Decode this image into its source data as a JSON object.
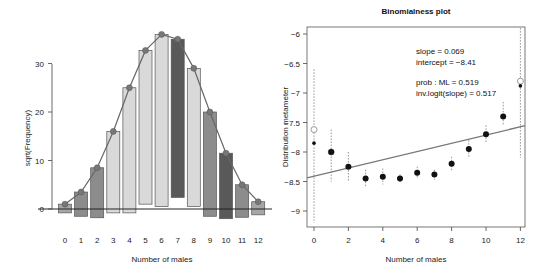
{
  "chart_data": [
    {
      "type": "bar",
      "subtype": "hanging-rootogram",
      "title": "",
      "xlabel": "Number of males",
      "ylabel": "sqrt(Frequency)",
      "categories": [
        "0",
        "1",
        "2",
        "3",
        "4",
        "5",
        "6",
        "7",
        "8",
        "9",
        "10",
        "11",
        "12"
      ],
      "yticks": [
        "0",
        "10",
        "20",
        "30"
      ],
      "ylim": [
        -3,
        38
      ],
      "series": [
        {
          "name": "fitted (sqrt expected)",
          "values": [
            1.0,
            3.5,
            8.5,
            16.0,
            25.0,
            32.7,
            36.0,
            35.0,
            29.0,
            20.0,
            11.5,
            5.0,
            1.5
          ]
        },
        {
          "name": "bar bottom (fitted - sqrt observed)",
          "values": [
            -0.8,
            -1.5,
            -1.8,
            -0.8,
            -0.8,
            1.0,
            0.5,
            2.4,
            0.5,
            -1.5,
            -2.0,
            -1.7,
            -1.2
          ]
        }
      ],
      "bar_colors": [
        "#a6a6a6",
        "#8c8c8c",
        "#8c8c8c",
        "#d9d9d9",
        "#d9d9d9",
        "#d9d9d9",
        "#d9d9d9",
        "#595959",
        "#d9d9d9",
        "#8c8c8c",
        "#595959",
        "#8c8c8c",
        "#a6a6a6"
      ],
      "grid": false
    },
    {
      "type": "scatter",
      "title": "Binomialness plot",
      "xlabel": "Number of males",
      "ylabel": "Distribution metameter",
      "x": [
        0,
        1,
        2,
        3,
        4,
        5,
        6,
        7,
        8,
        9,
        10,
        11,
        12
      ],
      "xticks": [
        "0",
        "2",
        "4",
        "6",
        "8",
        "10",
        "12"
      ],
      "yticks": [
        "-6",
        "-6.5",
        "-7",
        "-7.5",
        "-8",
        "-8.5",
        "-9"
      ],
      "ylim": [
        -9.25,
        -5.9
      ],
      "xlim": [
        -0.4,
        12.4
      ],
      "series": [
        {
          "name": "count metameter",
          "values": [
            -7.85,
            -8.0,
            -8.25,
            -8.45,
            -8.42,
            -8.45,
            -8.35,
            -8.38,
            -8.2,
            -7.95,
            -7.7,
            -7.4,
            -6.88
          ]
        },
        {
          "name": "open points (single counts)",
          "x": [
            0,
            1,
            12
          ],
          "values": [
            -7.62,
            -8.0,
            -6.8
          ]
        }
      ],
      "confidence_intervals": {
        "x": [
          0,
          1,
          2,
          3,
          4,
          5,
          6,
          7,
          8,
          9,
          10,
          11,
          12
        ],
        "lower": [
          -9.2,
          -8.5,
          -8.5,
          -8.6,
          -8.55,
          -8.52,
          -8.45,
          -8.47,
          -8.32,
          -8.1,
          -7.85,
          -7.55,
          -8.1
        ],
        "upper": [
          -6.6,
          -7.62,
          -8.0,
          -8.3,
          -8.28,
          -8.38,
          -8.25,
          -8.3,
          -8.08,
          -7.8,
          -7.55,
          -7.15,
          -5.9
        ]
      },
      "fit_line": {
        "slope": 0.069,
        "intercept": -8.41
      },
      "annotations": [
        "slope = 0.069",
        "intercept = −8.41",
        "prob : ML = 0.519",
        "inv.logit(slope) = 0.517"
      ],
      "grid": false
    }
  ],
  "left_plot": {
    "title": "",
    "xlabel": "Number of males",
    "ylabel": "sqrt(Frequency)",
    "xticks": [
      "0",
      "1",
      "2",
      "3",
      "4",
      "5",
      "6",
      "7",
      "8",
      "9",
      "10",
      "11",
      "12"
    ],
    "yticks": [
      "0",
      "10",
      "20",
      "30"
    ]
  },
  "right_plot": {
    "title": "Binomialness plot",
    "xlabel": "Number of males",
    "ylabel": "Distribution metameter",
    "xticks": [
      "0",
      "2",
      "4",
      "6",
      "8",
      "10",
      "12"
    ],
    "yticks": [
      "−6",
      "−6.5",
      "−7",
      "−7.5",
      "−8",
      "−8.5",
      "−9"
    ],
    "annotations": {
      "slope": "slope = 0.069",
      "intercept": "intercept = −8.41",
      "prob_ml": "prob : ML = 0.519",
      "inv_logit": "inv.logit(slope) = 0.517"
    }
  }
}
